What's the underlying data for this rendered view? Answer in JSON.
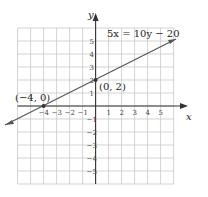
{
  "chart_data": {
    "type": "line",
    "title": "",
    "equation_label": "5x = 10y − 20",
    "xlabel": "x",
    "ylabel": "y",
    "xlim": [
      -6,
      6
    ],
    "ylim": [
      -6,
      6
    ],
    "grid": true,
    "x_ticks": [
      "−4",
      "−3",
      "−2",
      "−1",
      "1",
      "2",
      "3",
      "4",
      "5"
    ],
    "y_ticks": [
      "5",
      "4",
      "3",
      "2",
      "1",
      "−1",
      "−2",
      "−3",
      "−4",
      "−5"
    ],
    "series": [
      {
        "name": "5x = 10y − 20",
        "x": [
          -6,
          6
        ],
        "y": [
          -1,
          5
        ]
      }
    ],
    "points": [
      {
        "label": "(−4, 0)",
        "x": -4,
        "y": 0
      },
      {
        "label": "(0, 2)",
        "x": 0,
        "y": 2
      }
    ]
  },
  "labels": {
    "equation": "5x = 10y − 20",
    "x_axis": "x",
    "y_axis": "y",
    "point_a": "(−4, 0)",
    "point_b": "(0, 2)"
  }
}
